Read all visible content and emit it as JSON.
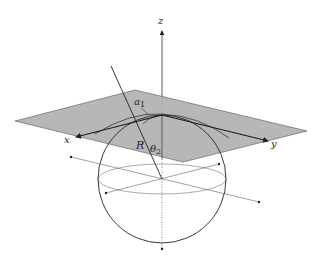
{
  "diagram": {
    "type": "3d-geometry",
    "labels": {
      "z_axis": "z",
      "x_axis": "x",
      "y_axis": "y",
      "radius": "R",
      "angle_a": "a",
      "angle_a_sub": "1",
      "angle_theta": "θ",
      "angle_theta_sub": "2"
    },
    "colors": {
      "plane_fill": "#b3b3b3",
      "stroke": "#222222",
      "background": "#ffffff"
    }
  }
}
